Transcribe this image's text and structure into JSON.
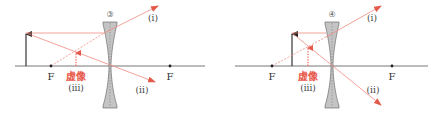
{
  "colors": {
    "ray": "#ef8a80",
    "ray_head": "#e25a4a",
    "image": "#e8584a",
    "axis": "#555555",
    "object": "#222222",
    "lens_fill": "#bdbdbd",
    "lens_stroke": "#6f6f6f"
  },
  "diagrams": [
    {
      "id": "3",
      "number_label": "③",
      "focal_left_label": "F",
      "focal_right_label": "F",
      "virtual_image_label": "虚像",
      "ray_labels": {
        "i": "(i)",
        "ii": "(ii)",
        "iii": "(iii)"
      },
      "description": "Concave lens, object placed beyond F; virtual, upright, reduced image between F and lens"
    },
    {
      "id": "4",
      "number_label": "④",
      "focal_left_label": "F",
      "focal_right_label": "F",
      "virtual_image_label": "虚像",
      "ray_labels": {
        "i": "(i)",
        "ii": "(ii)",
        "iii": "(iii)"
      },
      "description": "Concave lens, object placed inside F; virtual, upright, reduced image between object and lens"
    }
  ]
}
